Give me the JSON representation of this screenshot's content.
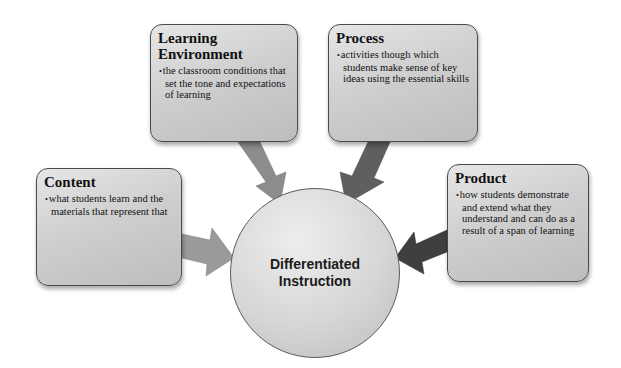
{
  "diagram": {
    "center": {
      "line1": "Differentiated",
      "line2": "Instruction"
    },
    "nodes": [
      {
        "id": "learning-environment",
        "title_line1": "Learning",
        "title_line2": "Environment",
        "bullet": "the classroom conditions that set the tone and expectations of learning"
      },
      {
        "id": "process",
        "title": "Process",
        "bullet": "activities though which students make sense of key ideas using the essential skills"
      },
      {
        "id": "content",
        "title": "Content",
        "bullet": "what students learn and the materials that represent that"
      },
      {
        "id": "product",
        "title": "Product",
        "bullet": "how students demonstrate and extend what they understand and can do as a result of a span of learning"
      }
    ],
    "arrow_colors": {
      "learning_environment": "#8c8c8c",
      "process": "#5f5f5f",
      "content": "#9a9a9a",
      "product": "#3f3f3f"
    },
    "bullet_glyph": "•"
  }
}
